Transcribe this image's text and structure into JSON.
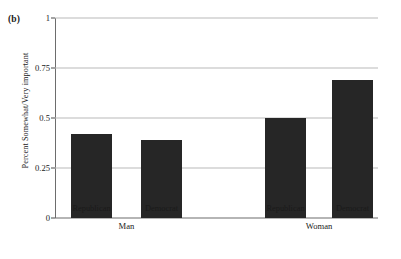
{
  "figure": {
    "panel_label": "(b)",
    "ylabel": "Percent Somewhat/Very important",
    "bar_color": "#262626",
    "grid_color": "#b9b9b9",
    "axis_color": "#6d6d6d"
  },
  "chart_data": {
    "type": "bar",
    "title": "(b)",
    "xlabel": "",
    "ylabel": "Percent Somewhat/Very important",
    "ylim": [
      0,
      1
    ],
    "yticks": [
      0,
      0.25,
      0.5,
      0.75,
      1
    ],
    "ytick_labels": [
      "0",
      "0.25",
      "0.5",
      "0.75",
      "1"
    ],
    "grid": true,
    "legend": "none",
    "categories": [
      "Republican",
      "Democrat",
      "Republican",
      "Democrat"
    ],
    "groups": [
      "Man",
      "Woman"
    ],
    "group_spans": [
      2,
      2
    ],
    "values": [
      0.42,
      0.39,
      0.5,
      0.69
    ],
    "bars": [
      {
        "group": "Man",
        "category": "Republican",
        "value": 0.42
      },
      {
        "group": "Man",
        "category": "Democrat",
        "value": 0.39
      },
      {
        "group": "Woman",
        "category": "Republican",
        "value": 0.5
      },
      {
        "group": "Woman",
        "category": "Democrat",
        "value": 0.69
      }
    ]
  }
}
